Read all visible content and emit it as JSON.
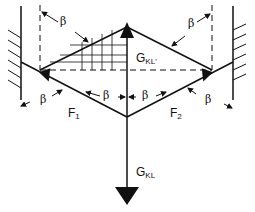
{
  "diagram": {
    "labels": {
      "beta": "β",
      "f1": "F",
      "f1_sub": "1",
      "f2": "F",
      "f2_sub": "2",
      "gkl_top": "G",
      "gkl_top_sub": "KL'",
      "gkl_bottom": "G",
      "gkl_bottom_sub": "KL"
    },
    "colors": {
      "line": "#111111",
      "background": "#ffffff"
    }
  }
}
